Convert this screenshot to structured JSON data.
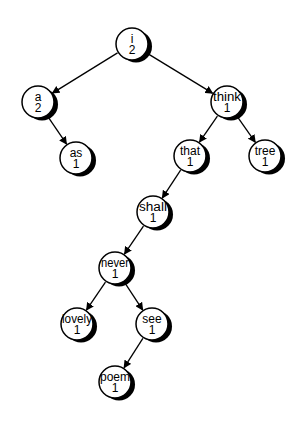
{
  "diagram": {
    "type": "binary-search-tree",
    "colors": {
      "background": "#ffffff",
      "node_fill": "#ffffff",
      "node_stroke": "#000000",
      "node_shadow": "#000000",
      "edge": "#000000",
      "text": "#000000"
    },
    "nodes": [
      {
        "id": "i",
        "word": "i",
        "count": "2",
        "x": 132,
        "y": 44
      },
      {
        "id": "a",
        "word": "a",
        "count": "2",
        "x": 38,
        "y": 102
      },
      {
        "id": "think",
        "word": "think",
        "count": "1",
        "x": 227,
        "y": 102
      },
      {
        "id": "as",
        "word": "as",
        "count": "1",
        "x": 76,
        "y": 158
      },
      {
        "id": "that",
        "word": "that",
        "count": "1",
        "x": 190,
        "y": 156
      },
      {
        "id": "tree",
        "word": "tree",
        "count": "1",
        "x": 265,
        "y": 156
      },
      {
        "id": "shall",
        "word": "shall",
        "count": "1",
        "x": 153,
        "y": 212
      },
      {
        "id": "never",
        "word": "never",
        "count": "1",
        "x": 115,
        "y": 268
      },
      {
        "id": "lovely",
        "word": "lovely",
        "count": "1",
        "x": 77,
        "y": 324
      },
      {
        "id": "see",
        "word": "see",
        "count": "1",
        "x": 152,
        "y": 324
      },
      {
        "id": "poem",
        "word": "poem",
        "count": "1",
        "x": 115,
        "y": 382
      }
    ],
    "edges": [
      {
        "from": "i",
        "to": "a"
      },
      {
        "from": "i",
        "to": "think"
      },
      {
        "from": "a",
        "to": "as"
      },
      {
        "from": "think",
        "to": "that"
      },
      {
        "from": "think",
        "to": "tree"
      },
      {
        "from": "that",
        "to": "shall"
      },
      {
        "from": "shall",
        "to": "never"
      },
      {
        "from": "never",
        "to": "lovely"
      },
      {
        "from": "never",
        "to": "see"
      },
      {
        "from": "see",
        "to": "poem"
      }
    ],
    "node_radius": 16,
    "shadow_offset": 4
  }
}
